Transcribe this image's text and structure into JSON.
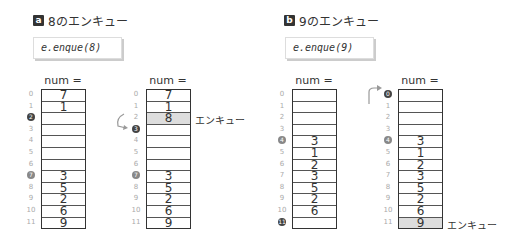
{
  "sections": [
    {
      "badge": "a",
      "title": "8のエンキュー",
      "code": "e.enque(8)",
      "before": {
        "label": "num = 7",
        "cells": [
          "7",
          "1",
          "",
          "",
          "",
          "",
          "",
          "3",
          "5",
          "2",
          "6",
          "9"
        ],
        "markers": {
          "2": "tail",
          "7": "head"
        }
      },
      "after": {
        "label": "num = 8",
        "cells": [
          "7",
          "1",
          "8",
          "",
          "",
          "",
          "",
          "3",
          "5",
          "2",
          "6",
          "9"
        ],
        "highlight": 2,
        "markers": {
          "3": "tail",
          "7": "head"
        },
        "annotation": "エンキュー"
      }
    },
    {
      "badge": "b",
      "title": "9のエンキュー",
      "code": "e.enque(9)",
      "before": {
        "label": "num = 7",
        "cells": [
          "",
          "",
          "",
          "",
          "3",
          "1",
          "2",
          "3",
          "5",
          "2",
          "6",
          ""
        ],
        "markers": {
          "4": "head",
          "11": "tail"
        }
      },
      "after": {
        "label": "num = 8",
        "cells": [
          "",
          "",
          "",
          "",
          "3",
          "1",
          "2",
          "3",
          "5",
          "2",
          "6",
          "9"
        ],
        "highlight": 11,
        "markers": {
          "0": "tail",
          "4": "head"
        },
        "annotation": "エンキュー"
      }
    }
  ],
  "indices": [
    "0",
    "1",
    "2",
    "3",
    "4",
    "5",
    "6",
    "7",
    "8",
    "9",
    "10",
    "11"
  ]
}
